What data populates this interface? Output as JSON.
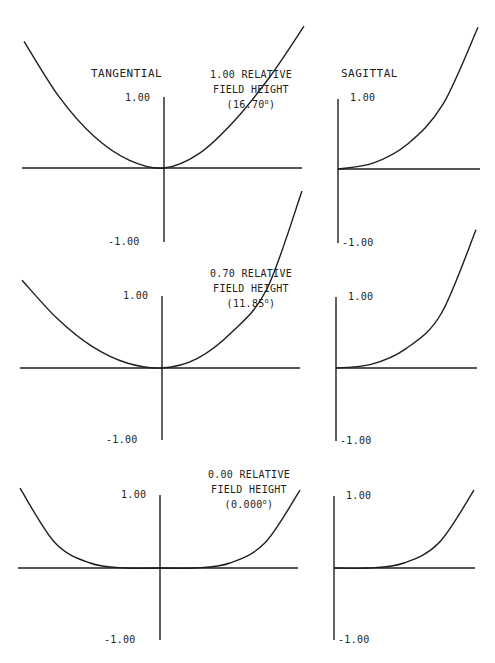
{
  "figure": {
    "headers": {
      "tangential": "TANGENTIAL",
      "sagittal": "SAGITTAL"
    },
    "panels": [
      {
        "id": "field-1.00",
        "field_label_line1": "1.00 RELATIVE",
        "field_label_line2": "FIELD HEIGHT",
        "field_angle": "(16.70",
        "field_angle_suffix": ")",
        "tangential": {
          "y_max_label": "1.00",
          "y_min_label": "-1.00"
        },
        "sagittal": {
          "y_max_label": "1.00",
          "y_min_label": "-1.00"
        }
      },
      {
        "id": "field-0.70",
        "field_label_line1": "0.70 RELATIVE",
        "field_label_line2": "FIELD HEIGHT",
        "field_angle": "(11.85",
        "field_angle_suffix": ")",
        "tangential": {
          "y_max_label": "1.00",
          "y_min_label": "-1.00"
        },
        "sagittal": {
          "y_max_label": "1.00",
          "y_min_label": "-1.00"
        }
      },
      {
        "id": "field-0.00",
        "field_label_line1": "0.00 RELATIVE",
        "field_label_line2": "FIELD HEIGHT",
        "field_angle": "(0.000",
        "field_angle_suffix": ")",
        "tangential": {
          "y_max_label": "1.00",
          "y_min_label": "-1.00"
        },
        "sagittal": {
          "y_max_label": "1.00",
          "y_min_label": "-1.00"
        }
      }
    ]
  },
  "chart_data": [
    {
      "type": "line",
      "title": "TANGENTIAL — 1.00 RELATIVE FIELD HEIGHT (16.70°)",
      "xlabel": "Relative pupil coordinate",
      "ylabel": "Ray aberration",
      "xlim": [
        -1,
        1
      ],
      "ylim": [
        -1.0,
        1.0
      ],
      "y_tick_labels": [
        "1.00",
        "-1.00"
      ],
      "grid": false,
      "series": [
        {
          "name": "tangential",
          "x": [
            -1.0,
            -0.75,
            -0.5,
            -0.25,
            0.0,
            0.25,
            0.5,
            0.75,
            1.0
          ],
          "y": [
            1.76,
            0.99,
            0.44,
            0.11,
            0.0,
            0.2,
            0.65,
            1.25,
            1.97
          ]
        }
      ]
    },
    {
      "type": "line",
      "title": "SAGITTAL — 1.00 RELATIVE FIELD HEIGHT (16.70°)",
      "xlabel": "Relative pupil coordinate",
      "ylabel": "Ray aberration",
      "xlim": [
        0,
        1
      ],
      "ylim": [
        -1.0,
        1.0
      ],
      "y_tick_labels": [
        "1.00",
        "-1.00"
      ],
      "grid": false,
      "series": [
        {
          "name": "sagittal",
          "x": [
            0.0,
            0.25,
            0.5,
            0.75,
            1.0
          ],
          "y": [
            0.0,
            0.08,
            0.35,
            0.9,
            1.97
          ]
        }
      ]
    },
    {
      "type": "line",
      "title": "TANGENTIAL — 0.70 RELATIVE FIELD HEIGHT (11.85°)",
      "xlabel": "Relative pupil coordinate",
      "ylabel": "Ray aberration",
      "xlim": [
        -1,
        1
      ],
      "ylim": [
        -1.0,
        1.0
      ],
      "y_tick_labels": [
        "1.00",
        "-1.00"
      ],
      "grid": false,
      "series": [
        {
          "name": "tangential",
          "x": [
            -1.0,
            -0.75,
            -0.5,
            -0.25,
            0.0,
            0.25,
            0.5,
            0.75,
            1.0
          ],
          "y": [
            1.22,
            0.69,
            0.3,
            0.07,
            0.0,
            0.13,
            0.5,
            1.1,
            2.46
          ]
        }
      ]
    },
    {
      "type": "line",
      "title": "SAGITTAL — 0.70 RELATIVE FIELD HEIGHT (11.85°)",
      "xlabel": "Relative pupil coordinate",
      "ylabel": "Ray aberration",
      "xlim": [
        0,
        1
      ],
      "ylim": [
        -1.0,
        1.0
      ],
      "y_tick_labels": [
        "1.00",
        "-1.00"
      ],
      "grid": false,
      "series": [
        {
          "name": "sagittal",
          "x": [
            0.0,
            0.25,
            0.5,
            0.75,
            1.0
          ],
          "y": [
            0.0,
            0.05,
            0.27,
            0.75,
            1.92
          ]
        }
      ]
    },
    {
      "type": "line",
      "title": "TANGENTIAL — 0.00 RELATIVE FIELD HEIGHT (0.000°)",
      "xlabel": "Relative pupil coordinate",
      "ylabel": "Ray aberration",
      "xlim": [
        -1,
        1
      ],
      "ylim": [
        -1.0,
        1.0
      ],
      "y_tick_labels": [
        "1.00",
        "-1.00"
      ],
      "grid": false,
      "series": [
        {
          "name": "tangential",
          "x": [
            -1.0,
            -0.75,
            -0.5,
            -0.25,
            0.0,
            0.25,
            0.5,
            0.75,
            1.0
          ],
          "y": [
            1.11,
            0.35,
            0.07,
            0.0,
            0.0,
            0.0,
            0.07,
            0.35,
            1.08
          ]
        }
      ]
    },
    {
      "type": "line",
      "title": "SAGITTAL — 0.00 RELATIVE FIELD HEIGHT (0.000°)",
      "xlabel": "Relative pupil coordinate",
      "ylabel": "Ray aberration",
      "xlim": [
        0,
        1
      ],
      "ylim": [
        -1.0,
        1.0
      ],
      "y_tick_labels": [
        "1.00",
        "-1.00"
      ],
      "grid": false,
      "series": [
        {
          "name": "sagittal",
          "x": [
            0.0,
            0.25,
            0.5,
            0.75,
            1.0
          ],
          "y": [
            0.0,
            0.0,
            0.07,
            0.35,
            1.08
          ]
        }
      ]
    }
  ]
}
